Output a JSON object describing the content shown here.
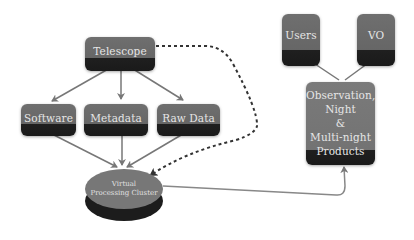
{
  "nodes": {
    "telescope": "Telescope",
    "software": "Software",
    "metadata": "Metadata",
    "raw_data": "Raw Data",
    "cluster": {
      "line1": "Virtual",
      "line2": "Processing Cluster"
    },
    "products": {
      "line1": "Observation,",
      "line2": "Night",
      "line3": "&",
      "line4": "Multi-night",
      "line5": "Products"
    },
    "users": "Users",
    "vo": "VO"
  },
  "colors": {
    "box_top": "#6f6f6f",
    "box_bottom": "#1a1a1a",
    "text": "#e6e6e6",
    "arrow": "#777777",
    "dashed": "#333333"
  }
}
